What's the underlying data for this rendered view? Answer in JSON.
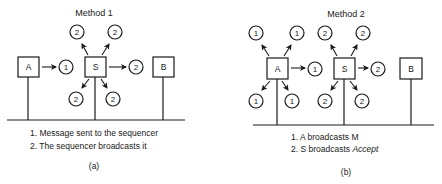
{
  "panels": [
    {
      "id": "a",
      "title": "Method 1",
      "nodes": [
        {
          "label": "A",
          "x": 28,
          "y": 67
        },
        {
          "label": "S",
          "x": 95,
          "y": 67
        },
        {
          "label": "B",
          "x": 163,
          "y": 67
        }
      ],
      "messages": [
        {
          "label": "1",
          "x": 66,
          "y": 67
        },
        {
          "label": "2",
          "x": 77,
          "y": 32
        },
        {
          "label": "2",
          "x": 115,
          "y": 32
        },
        {
          "label": "2",
          "x": 136,
          "y": 67
        },
        {
          "label": "2",
          "x": 76,
          "y": 99
        },
        {
          "label": "2",
          "x": 113,
          "y": 99
        }
      ],
      "steps": [
        "1. Message sent to the sequencer",
        "2. The sequencer broadcasts it"
      ],
      "caption": "(a)"
    },
    {
      "id": "b",
      "title": "Method 2",
      "nodes": [
        {
          "label": "A",
          "x": 278,
          "y": 68
        },
        {
          "label": "S",
          "x": 345,
          "y": 68
        },
        {
          "label": "B",
          "x": 411,
          "y": 68
        }
      ],
      "messages": [
        {
          "label": "1",
          "x": 256,
          "y": 33
        },
        {
          "label": "1",
          "x": 297,
          "y": 33
        },
        {
          "label": "1",
          "x": 315,
          "y": 69
        },
        {
          "label": "1",
          "x": 256,
          "y": 101
        },
        {
          "label": "1",
          "x": 292,
          "y": 101
        },
        {
          "label": "2",
          "x": 325,
          "y": 33
        },
        {
          "label": "2",
          "x": 363,
          "y": 33
        },
        {
          "label": "2",
          "x": 378,
          "y": 69
        },
        {
          "label": "2",
          "x": 325,
          "y": 101
        },
        {
          "label": "2",
          "x": 362,
          "y": 101
        }
      ],
      "steps": [
        "1. A broadcasts M",
        "2. S broadcasts "
      ],
      "step2_emphasis": "Accept",
      "caption": "(b)"
    }
  ]
}
